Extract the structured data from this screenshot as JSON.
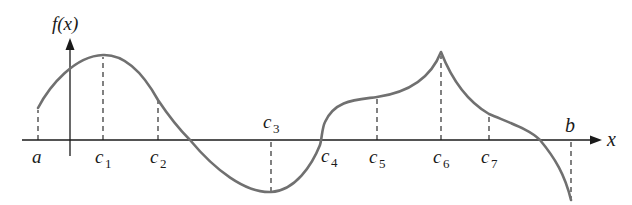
{
  "figure": {
    "y_axis_label": "f(x)",
    "x_axis_label": "x",
    "curve_color": "#707070",
    "axis_color": "#1a1a1a",
    "points": [
      {
        "name": "a",
        "label": "a",
        "sub": "",
        "x": 38,
        "fy": 108,
        "label_pos": "below"
      },
      {
        "name": "c1",
        "label": "c",
        "sub": "1",
        "x": 103,
        "fy": 55,
        "label_pos": "below"
      },
      {
        "name": "c2",
        "label": "c",
        "sub": "2",
        "x": 158,
        "fy": 100,
        "label_pos": "below"
      },
      {
        "name": "c3",
        "label": "c",
        "sub": "3",
        "x": 271,
        "fy": 192,
        "label_pos": "above"
      },
      {
        "name": "c4",
        "label": "c",
        "sub": "4",
        "x": 323,
        "fy": 140,
        "label_pos": "below"
      },
      {
        "name": "c5",
        "label": "c",
        "sub": "5",
        "x": 377,
        "fy": 97,
        "label_pos": "below"
      },
      {
        "name": "c6",
        "label": "c",
        "sub": "6",
        "x": 441,
        "fy": 52,
        "label_pos": "below"
      },
      {
        "name": "c7",
        "label": "c",
        "sub": "7",
        "x": 489,
        "fy": 114,
        "label_pos": "below"
      },
      {
        "name": "b",
        "label": "b",
        "sub": "",
        "x": 571,
        "fy": 200,
        "label_pos": "above"
      }
    ]
  }
}
